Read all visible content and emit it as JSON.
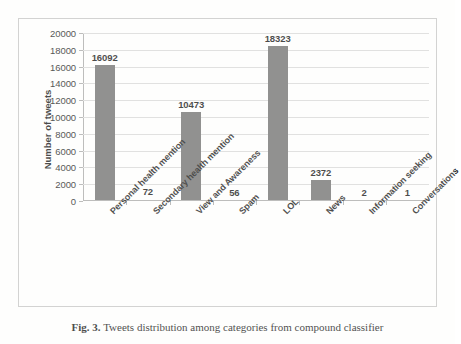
{
  "chart_data": {
    "type": "bar",
    "title": "",
    "xlabel": "",
    "ylabel": "Number of tweets",
    "ylim": [
      0,
      20000
    ],
    "ytick_step": 2000,
    "grid": true,
    "legend": "none",
    "bar_color": "#6e6e6e",
    "gridline_color": "#d9d9d9",
    "axis_color": "#a8a8a8",
    "categories": [
      "Personal health mention",
      "Secondary health mention",
      "View and Awareness",
      "Spam",
      "LOL",
      "News",
      "Information seeking",
      "Conversations"
    ],
    "values": [
      16092,
      72,
      10473,
      56,
      18323,
      2372,
      2,
      1
    ],
    "value_labels": [
      "16092",
      "72",
      "10473",
      "56",
      "18323",
      "2372",
      "2",
      "1"
    ],
    "ytick_labels": [
      "0",
      "2000",
      "4000",
      "6000",
      "8000",
      "10000",
      "12000",
      "14000",
      "16000",
      "18000",
      "20000"
    ]
  },
  "caption": {
    "label": "Fig. 3.",
    "text": " Tweets distribution among categories from compound classifier"
  }
}
